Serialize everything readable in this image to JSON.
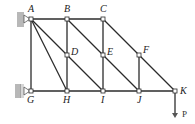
{
  "diagram": {
    "type": "truss",
    "nodes": [
      {
        "id": "A",
        "x": 31,
        "y": 19,
        "label": "A",
        "lx": 28,
        "ly": 12
      },
      {
        "id": "B",
        "x": 67,
        "y": 19,
        "label": "B",
        "lx": 64,
        "ly": 12
      },
      {
        "id": "C",
        "x": 103,
        "y": 19,
        "label": "C",
        "lx": 100,
        "ly": 12
      },
      {
        "id": "D",
        "x": 67,
        "y": 55,
        "label": "D",
        "lx": 71,
        "ly": 55
      },
      {
        "id": "E",
        "x": 103,
        "y": 55,
        "label": "E",
        "lx": 107,
        "ly": 55
      },
      {
        "id": "F",
        "x": 139,
        "y": 55,
        "label": "F",
        "lx": 143,
        "ly": 53
      },
      {
        "id": "G",
        "x": 31,
        "y": 91,
        "label": "G",
        "lx": 27,
        "ly": 103
      },
      {
        "id": "H",
        "x": 67,
        "y": 91,
        "label": "H",
        "lx": 63,
        "ly": 103
      },
      {
        "id": "I",
        "x": 103,
        "y": 91,
        "label": "I",
        "lx": 101,
        "ly": 103
      },
      {
        "id": "J",
        "x": 139,
        "y": 91,
        "label": "J",
        "lx": 137,
        "ly": 103
      },
      {
        "id": "K",
        "x": 175,
        "y": 91,
        "label": "K",
        "lx": 180,
        "ly": 94
      }
    ],
    "members": [
      [
        "A",
        "B"
      ],
      [
        "B",
        "C"
      ],
      [
        "G",
        "H"
      ],
      [
        "H",
        "I"
      ],
      [
        "I",
        "J"
      ],
      [
        "J",
        "K"
      ],
      [
        "A",
        "G"
      ],
      [
        "B",
        "D"
      ],
      [
        "D",
        "H"
      ],
      [
        "C",
        "E"
      ],
      [
        "E",
        "I"
      ],
      [
        "F",
        "J"
      ],
      [
        "A",
        "D"
      ],
      [
        "A",
        "H"
      ],
      [
        "B",
        "E"
      ],
      [
        "D",
        "I"
      ],
      [
        "C",
        "F"
      ],
      [
        "E",
        "J"
      ],
      [
        "F",
        "K"
      ]
    ],
    "supports": [
      {
        "node": "A",
        "type": "pin",
        "side": "left"
      },
      {
        "node": "G",
        "type": "roller",
        "side": "left"
      }
    ],
    "load": {
      "node": "K",
      "label": "P",
      "direction": "down",
      "length": 27,
      "lx": 182,
      "ly": 117
    }
  }
}
